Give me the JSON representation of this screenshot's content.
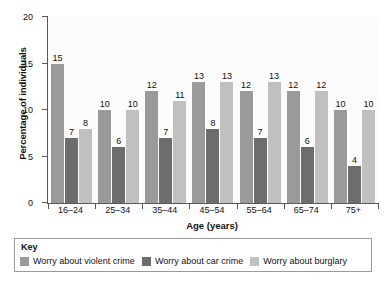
{
  "chart_data": {
    "type": "bar",
    "title": "",
    "xlabel": "Age (years)",
    "ylabel": "Percentage of individuals",
    "ylim": [
      0,
      20
    ],
    "yticks": [
      0,
      5,
      10,
      15,
      20
    ],
    "grid": false,
    "legend_position": "bottom",
    "legend_title": "Key",
    "categories": [
      "16–24",
      "25–34",
      "35–44",
      "45–54",
      "55–64",
      "65–74",
      "75+"
    ],
    "series": [
      {
        "name": "Worry about violent crime",
        "color": "#9a9a9a",
        "values": [
          15,
          10,
          12,
          13,
          12,
          12,
          10
        ]
      },
      {
        "name": "Worry about car crime",
        "color": "#6d6d6d",
        "values": [
          7,
          6,
          7,
          8,
          7,
          6,
          4
        ]
      },
      {
        "name": "Worry about burglary",
        "color": "#c0c0c0",
        "values": [
          8,
          10,
          11,
          13,
          13,
          12,
          10
        ]
      }
    ],
    "data_labels": true
  }
}
